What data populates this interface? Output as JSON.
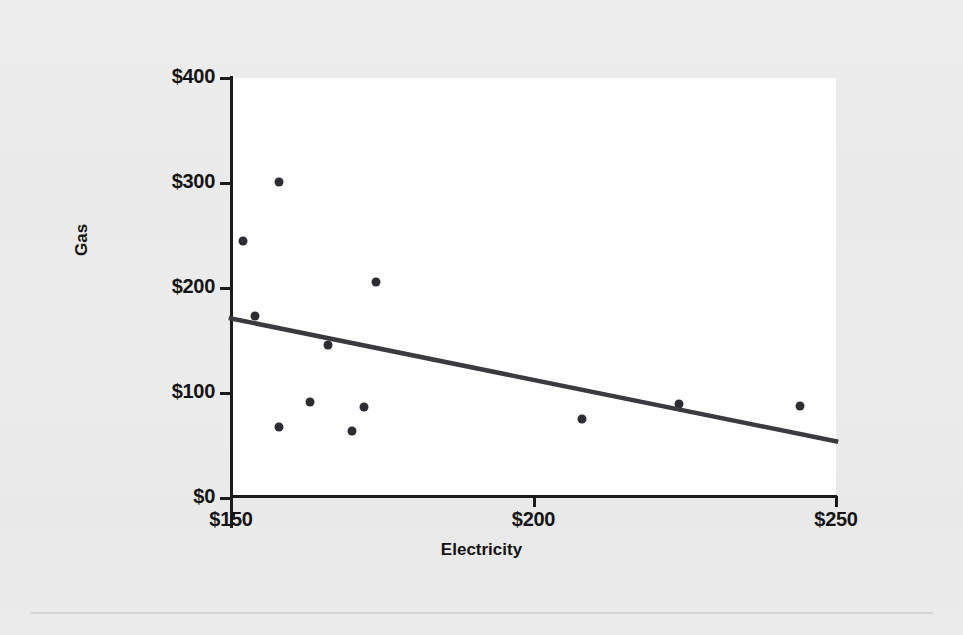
{
  "chart_data": {
    "type": "scatter",
    "title": "",
    "xlabel": "Electricity",
    "ylabel": "Gas",
    "xlim": [
      150,
      250
    ],
    "ylim": [
      0,
      400
    ],
    "xticks": [
      150,
      200,
      250
    ],
    "yticks": [
      0,
      100,
      200,
      300,
      400
    ],
    "xtick_labels": [
      "$150",
      "$200",
      "$250"
    ],
    "ytick_labels": [
      "$0",
      "$100",
      "$200",
      "$300",
      "$400"
    ],
    "grid": false,
    "legend": false,
    "points": [
      {
        "x": 152,
        "y": 245
      },
      {
        "x": 158,
        "y": 301
      },
      {
        "x": 154,
        "y": 173
      },
      {
        "x": 174,
        "y": 206
      },
      {
        "x": 166,
        "y": 146
      },
      {
        "x": 163,
        "y": 91
      },
      {
        "x": 172,
        "y": 87
      },
      {
        "x": 158,
        "y": 68
      },
      {
        "x": 170,
        "y": 64
      },
      {
        "x": 208,
        "y": 75
      },
      {
        "x": 224,
        "y": 90
      },
      {
        "x": 244,
        "y": 88
      }
    ],
    "trendline": {
      "type": "linear-fit",
      "x0": 150,
      "y0": 171,
      "x1": 250,
      "y1": 54
    },
    "marker_color": "#2c2c32",
    "trendline_color": "#3a3a3f",
    "panel_color": "#ffffff",
    "background_color": "#ebebeb"
  },
  "axes": {
    "y_title": "Gas",
    "x_title": "Electricity"
  }
}
